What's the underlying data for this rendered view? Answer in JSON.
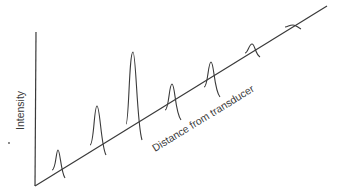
{
  "diagram": {
    "y_axis_label": "Intensity",
    "x_axis_label": "Distance from transducer",
    "colors": {
      "line": "#3a3a3a",
      "background": "#ffffff"
    },
    "peaks": [
      {
        "index": 1,
        "relative_height": 0.21
      },
      {
        "index": 2,
        "relative_height": 0.47
      },
      {
        "index": 3,
        "relative_height": 0.79
      },
      {
        "index": 4,
        "relative_height": 0.45
      },
      {
        "index": 5,
        "relative_height": 0.31
      },
      {
        "index": 6,
        "relative_height": 0.1
      },
      {
        "index": 7,
        "relative_height": 0.03
      }
    ]
  }
}
